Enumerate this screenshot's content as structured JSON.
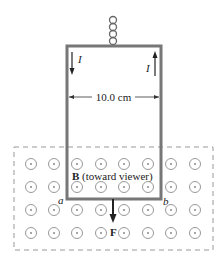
{
  "figure": {
    "current_label_left": "I",
    "current_label_right": "I",
    "width_label": "10.0 cm",
    "field_label_bold": "B",
    "field_label_rest": " (toward viewer)",
    "corner_a": "a",
    "corner_b": "b",
    "force_label": "F",
    "colors": {
      "wire": "#777777",
      "field_symbol": "#888888",
      "dashed_border": "#999999",
      "text": "#222222"
    }
  }
}
